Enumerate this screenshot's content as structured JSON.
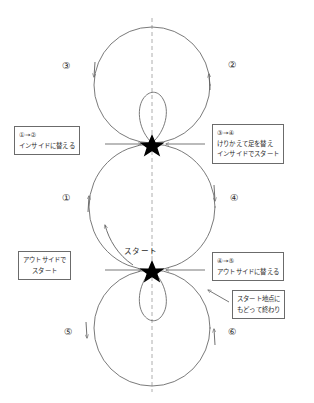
{
  "diagram": {
    "axis": "dashed-vertical-center-line",
    "stroke_color": "#6b6b6b",
    "marker_color": "#000000",
    "start_marker": "star",
    "start_label": "スタート",
    "steps": [
      {
        "id": "step-1",
        "label": "①",
        "side": "left",
        "direction": "up"
      },
      {
        "id": "step-2",
        "label": "②",
        "side": "right",
        "direction": "up"
      },
      {
        "id": "step-3",
        "label": "③",
        "side": "left",
        "direction": "down"
      },
      {
        "id": "step-4",
        "label": "④",
        "side": "right",
        "direction": "down"
      },
      {
        "id": "step-5",
        "label": "⑤",
        "side": "left",
        "direction": "down"
      },
      {
        "id": "step-6",
        "label": "⑥",
        "side": "right",
        "direction": "up"
      }
    ],
    "notes": [
      {
        "id": "note-1-to-2",
        "position": "upper-left",
        "lines": [
          "①→②",
          "インサイドに替える"
        ]
      },
      {
        "id": "note-3-to-4",
        "position": "upper-right",
        "lines": [
          "③→④",
          "けりかえて足を替え",
          "インサイドでスタート"
        ]
      },
      {
        "id": "note-start-outside",
        "position": "middle-left",
        "lines": [
          "アウトサイドで",
          "スタート"
        ]
      },
      {
        "id": "note-4-to-5",
        "position": "middle-right",
        "lines": [
          "④→⑤",
          "アウトサイドに替える"
        ]
      },
      {
        "id": "note-finish",
        "position": "lower-right",
        "lines": [
          "スタート地点に",
          "もどって終わり"
        ]
      }
    ]
  }
}
